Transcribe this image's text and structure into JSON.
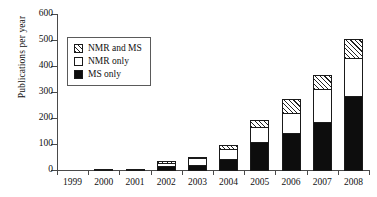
{
  "chart_data": {
    "type": "bar",
    "subtype": "stacked-bar",
    "title": "",
    "xlabel": "",
    "ylabel": "Publications per year",
    "categories": [
      "1999",
      "2000",
      "2001",
      "2002",
      "2003",
      "2004",
      "2005",
      "2006",
      "2007",
      "2008"
    ],
    "series": [
      {
        "name": "MS only",
        "values": [
          0,
          0,
          0,
          18,
          22,
          45,
          110,
          148,
          190,
          287
        ]
      },
      {
        "name": "NMR only",
        "values": [
          0,
          7,
          7,
          18,
          32,
          43,
          62,
          80,
          128,
          150
        ]
      },
      {
        "name": "NMR and MS",
        "values": [
          0,
          0,
          0,
          9,
          7,
          20,
          33,
          57,
          59,
          78
        ]
      }
    ],
    "totals": [
      0,
      7,
      7,
      45,
      61,
      108,
      205,
      285,
      377,
      515
    ],
    "ylim": [
      0,
      600
    ],
    "yticks": [
      0,
      100,
      200,
      300,
      400,
      500,
      600
    ],
    "ytick_labels": [
      "0",
      "100",
      "200",
      "300",
      "400",
      "500",
      "600"
    ],
    "grid": false,
    "legend_position": "upper-left-inside",
    "legend_entries": [
      {
        "label": "NMR and MS",
        "pattern": "hatched"
      },
      {
        "label": "NMR only",
        "pattern": "white"
      },
      {
        "label": "MS only",
        "pattern": "black"
      }
    ],
    "colors": {
      "ms_only": "#0d0d0d",
      "nmr_only": "#ffffff",
      "nmr_and_ms_hatch": "#222222",
      "axis": "#4a4a4a",
      "background": "#ffffff"
    }
  }
}
